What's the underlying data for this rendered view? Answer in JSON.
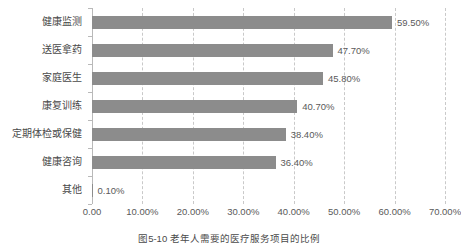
{
  "chart_data": {
    "type": "bar",
    "orientation": "horizontal",
    "title": "",
    "xlabel": "",
    "ylabel": "",
    "xlim": [
      0,
      70
    ],
    "grid": "vertical-dashed",
    "legend": "none",
    "bar_color": "#8c8c8c",
    "categories": [
      "健康监测",
      "送医拿药",
      "家庭医生",
      "康复训练",
      "定期体检或保健",
      "健康咨询",
      "其他"
    ],
    "values": [
      59.5,
      47.7,
      45.8,
      40.7,
      38.4,
      36.4,
      0.1
    ],
    "value_labels": [
      "59.50%",
      "47.70%",
      "45.80%",
      "40.70%",
      "38.40%",
      "36.40%",
      "0.10%"
    ],
    "xticks": [
      0,
      10,
      20,
      30,
      40,
      50,
      60,
      70
    ],
    "xtick_labels": [
      "0.00",
      "10.00%",
      "20.00%",
      "30.00%",
      "40.00%",
      "50.00%",
      "60.00%",
      "70.00%"
    ]
  },
  "caption": "图5-10  老年人需要的医疗服务项目的比例"
}
